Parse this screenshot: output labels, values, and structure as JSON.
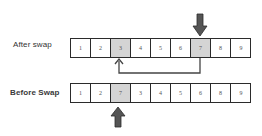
{
  "diagram": {
    "after": {
      "label": "After swap",
      "cells": [
        "1",
        "2",
        "3",
        "4",
        "5",
        "6",
        "7",
        "8",
        "9"
      ],
      "highlighted_indices": [
        2,
        6
      ]
    },
    "before": {
      "label": "Before Swap",
      "cells": [
        "1",
        "2",
        "7",
        "3",
        "4",
        "5",
        "6",
        "8",
        "9"
      ],
      "highlighted_indices": [
        2
      ]
    },
    "arrows": [
      {
        "name": "top-down-arrow",
        "points_to": "after row cell 7 (index 6)",
        "direction": "down"
      },
      {
        "name": "swap-connector-arrow",
        "from": "after row index 6",
        "to": "after row index 2",
        "direction": "up-left"
      },
      {
        "name": "bottom-up-arrow",
        "points_to": "before row cell 7 (index 2)",
        "direction": "up"
      }
    ],
    "colors": {
      "highlight": "#d4d4d4",
      "border": "#2b2b2b",
      "arrow_fill": "#555555"
    }
  }
}
